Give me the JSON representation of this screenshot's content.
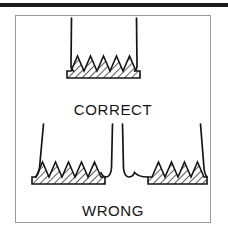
{
  "figure": {
    "title_rule_color": "#1b1b1b",
    "frame_color": "#9a9a9a",
    "background_color": "#ffffff",
    "ink_color": "#151515",
    "hatch_color": "#2a2a2a",
    "panels": [
      {
        "id": "correct",
        "caption": "CORRECT",
        "description": "Two needles held vertically, perpendicular to the serrated toothed block",
        "needle_count": 2,
        "tooth_count": 5,
        "needle_angle_deg": 0
      },
      {
        "id": "wrong",
        "caption": "WRONG",
        "description": "Needles leaning at an angle against the serrated toothed blocks",
        "needle_count": 4,
        "tooth_count": 5,
        "needle_angle_deg": 12
      }
    ],
    "captions": {
      "correct": "CORRECT",
      "wrong": "WRONG"
    }
  }
}
